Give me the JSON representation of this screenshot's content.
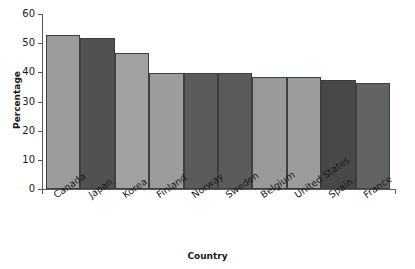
{
  "chart_data": {
    "type": "bar",
    "title": "",
    "xlabel": "Country",
    "ylabel": "Percentage",
    "categories": [
      "Canada",
      "Japan",
      "Korea",
      "Finland",
      "Norway",
      "Sweden",
      "Belgium",
      "United States",
      "Spain",
      "France"
    ],
    "values": [
      52.7,
      51.8,
      46.8,
      39.8,
      39.7,
      39.7,
      38.5,
      38.4,
      37.4,
      36.4
    ],
    "ylim": [
      0,
      60
    ],
    "yticks": [
      0,
      10,
      20,
      30,
      40,
      50,
      60
    ],
    "ytick_labels": [
      "0",
      "10",
      "20",
      "30",
      "40",
      "50",
      "60"
    ],
    "grid": false,
    "legend": null,
    "bar_colors": [
      "#9a9b9b",
      "#505151",
      "#a0a1a1",
      "#9b9c9c",
      "#5a5b5b",
      "#5a5b5b",
      "#989999",
      "#9a9b9b",
      "#474848",
      "#626363"
    ],
    "bar_edge_color": "#3c3f3f",
    "axis_color": "#555a5a",
    "background_color": "#ffffff"
  }
}
